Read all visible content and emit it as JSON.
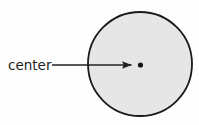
{
  "figure": {
    "kind": "geometry-diagram",
    "background_color": "#fefefe"
  },
  "labels": {
    "center": "center"
  },
  "shapes": {
    "circle": {
      "name": "circle-outline",
      "cx": 140,
      "cy": 64,
      "r": 52,
      "fill_color": "#e6e6e6",
      "stroke_color": "#1a1a1a",
      "stroke_width": 1.8
    },
    "center_dot": {
      "name": "center-point-dot",
      "cx": 140.5,
      "cy": 65,
      "r": 2.6,
      "fill_color": "#141414"
    },
    "arrow": {
      "name": "center-pointer-arrow",
      "x1": 52,
      "y1": 65,
      "x2": 133,
      "y2": 65,
      "stroke_color": "#231f20",
      "stroke_width": 1.5,
      "head_length": 9,
      "head_half_width": 4
    }
  },
  "text_positions": {
    "center_label": {
      "x": 8,
      "y": 65
    }
  },
  "chart_data": {
    "type": "diagram",
    "title": "",
    "elements": [
      {
        "label": "circle",
        "role": "shape",
        "center": [
          140,
          64
        ],
        "radius": 52
      },
      {
        "label": "center",
        "role": "annotated-point",
        "point": [
          140.5,
          65
        ]
      }
    ],
    "annotations": [
      {
        "text": "center",
        "points_to": [
          140.5,
          65
        ],
        "from": [
          52,
          65
        ]
      }
    ]
  }
}
